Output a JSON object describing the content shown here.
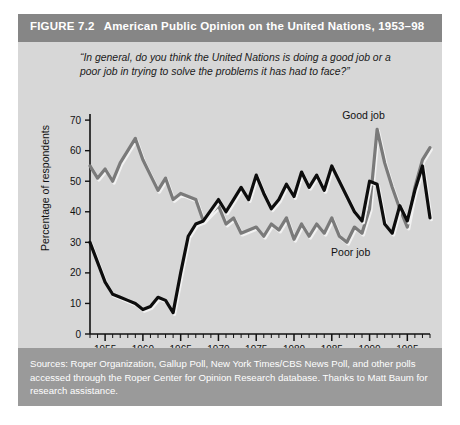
{
  "figure": {
    "number_label": "FIGURE 7.2",
    "title": "American Public Opinion on the United Nations, 1953–98",
    "header_bg": "#868686",
    "body_bg": "#d7d7d7",
    "source_bg": "#9a9a9a"
  },
  "question": "“In general, do you think the United Nations is doing a good job or a poor job in trying to solve the problems it has had to face?”",
  "source_note": "Sources: Roper Organization, Gallup Poll, New York Times/CBS News Poll, and other polls accessed through the Roper Center for Opinion Research database. Thanks to Matt Baum for research assistance.",
  "chart_data": {
    "type": "line",
    "title": "American Public Opinion on the United Nations, 1953–98",
    "xlabel": "",
    "ylabel": "Percentage of respondents",
    "xlim": [
      1953,
      1998
    ],
    "ylim": [
      0,
      72
    ],
    "ytick_values": [
      0,
      10,
      20,
      30,
      40,
      50,
      60,
      70
    ],
    "ytick_labels": [
      "0",
      "10",
      "20",
      "30",
      "40",
      "50",
      "60",
      "70"
    ],
    "xtick_major_values": [
      1955,
      1960,
      1965,
      1970,
      1975,
      1980,
      1985,
      1990,
      1995
    ],
    "xtick_major_labels": [
      "1955",
      "1960",
      "1965",
      "1970",
      "1975",
      "1980",
      "1985",
      "1990",
      "1995"
    ],
    "xtick_minor_step": 1,
    "grid": false,
    "legend_position": "inline-annotations",
    "series": [
      {
        "name": "Good job",
        "color": "#7a7a7a",
        "label_x": 1989.2,
        "label_y": 70.5,
        "points": [
          [
            1953,
            55
          ],
          [
            1954,
            51
          ],
          [
            1955,
            54
          ],
          [
            1956,
            50
          ],
          [
            1957,
            56
          ],
          [
            1958,
            60
          ],
          [
            1959,
            64
          ],
          [
            1960,
            57
          ],
          [
            1961,
            52
          ],
          [
            1962,
            47
          ],
          [
            1963,
            51
          ],
          [
            1964,
            44
          ],
          [
            1965,
            46
          ],
          [
            1966,
            45
          ],
          [
            1967,
            44
          ],
          [
            1968,
            37
          ],
          [
            1970,
            42
          ],
          [
            1971,
            36
          ],
          [
            1972,
            38
          ],
          [
            1973,
            33
          ],
          [
            1975,
            35
          ],
          [
            1976,
            32
          ],
          [
            1977,
            36
          ],
          [
            1978,
            34
          ],
          [
            1979,
            38
          ],
          [
            1980,
            31
          ],
          [
            1981,
            36
          ],
          [
            1982,
            32
          ],
          [
            1983,
            36
          ],
          [
            1984,
            33
          ],
          [
            1985,
            38
          ],
          [
            1986,
            32
          ],
          [
            1987,
            30
          ],
          [
            1988,
            35
          ],
          [
            1989,
            33
          ],
          [
            1990,
            41
          ],
          [
            1991,
            67
          ],
          [
            1992,
            56
          ],
          [
            1993,
            48
          ],
          [
            1994,
            41
          ],
          [
            1995,
            35
          ],
          [
            1996,
            48
          ],
          [
            1997,
            57
          ],
          [
            1998,
            61
          ]
        ]
      },
      {
        "name": "Poor job",
        "color": "#0d0d0d",
        "label_x": 1987.5,
        "label_y": 25.5,
        "points": [
          [
            1953,
            30
          ],
          [
            1955,
            17
          ],
          [
            1956,
            13
          ],
          [
            1957,
            12
          ],
          [
            1958,
            11
          ],
          [
            1959,
            10
          ],
          [
            1960,
            8
          ],
          [
            1961,
            9
          ],
          [
            1962,
            12
          ],
          [
            1963,
            11
          ],
          [
            1964,
            7
          ],
          [
            1965,
            20
          ],
          [
            1966,
            32
          ],
          [
            1967,
            36
          ],
          [
            1968,
            37
          ],
          [
            1970,
            44
          ],
          [
            1971,
            40
          ],
          [
            1972,
            44
          ],
          [
            1973,
            48
          ],
          [
            1974,
            44
          ],
          [
            1975,
            52
          ],
          [
            1976,
            46
          ],
          [
            1977,
            41
          ],
          [
            1978,
            44
          ],
          [
            1979,
            49
          ],
          [
            1980,
            45
          ],
          [
            1981,
            53
          ],
          [
            1982,
            48
          ],
          [
            1983,
            52
          ],
          [
            1984,
            47
          ],
          [
            1985,
            55
          ],
          [
            1986,
            50
          ],
          [
            1987,
            45
          ],
          [
            1988,
            40
          ],
          [
            1989,
            37
          ],
          [
            1990,
            50
          ],
          [
            1991,
            49
          ],
          [
            1992,
            36
          ],
          [
            1993,
            33
          ],
          [
            1994,
            42
          ],
          [
            1995,
            37
          ],
          [
            1996,
            47
          ],
          [
            1997,
            55
          ],
          [
            1998,
            38
          ]
        ]
      }
    ]
  }
}
